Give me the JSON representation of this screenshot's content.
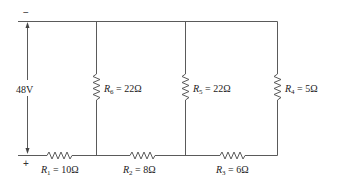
{
  "diagram": {
    "type": "circuit",
    "source": {
      "voltage_label": "48V",
      "negative_terminal": "−",
      "positive_terminal": "+"
    },
    "series_resistors": [
      {
        "name": "R",
        "sub": "1",
        "value": "= 10Ω"
      },
      {
        "name": "R",
        "sub": "2",
        "value": "= 8Ω"
      },
      {
        "name": "R",
        "sub": "3",
        "value": "= 6Ω"
      }
    ],
    "shunt_resistors": [
      {
        "name": "R",
        "sub": "6",
        "value": "= 22Ω"
      },
      {
        "name": "R",
        "sub": "5",
        "value": "= 22Ω"
      },
      {
        "name": "R",
        "sub": "4",
        "value": "= 5Ω"
      }
    ],
    "colors": {
      "wire": "#5a5a5a",
      "text": "#222222"
    }
  }
}
